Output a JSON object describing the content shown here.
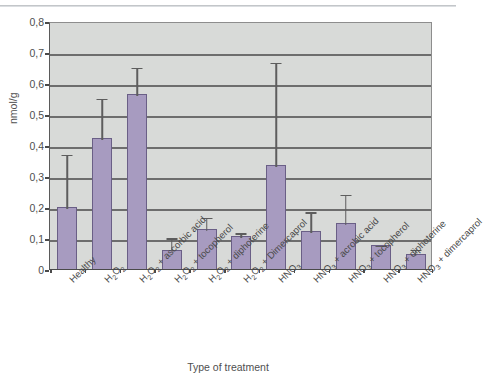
{
  "chart_data": {
    "type": "bar",
    "title": "",
    "xlabel": "Type of treatment",
    "ylabel": "nmol/g",
    "ylim": [
      0,
      0.8
    ],
    "ytick_step": 0.1,
    "grid": true,
    "legend": "none",
    "decimal_separator": ",",
    "ytick_labels": [
      "0,8",
      "0,7",
      "0,6",
      "0,5",
      "0,4",
      "0,3",
      "0,2",
      "0,1",
      "0"
    ],
    "ytick_values": [
      0.8,
      0.7,
      0.6,
      0.5,
      0.4,
      0.3,
      0.2,
      0.1,
      0
    ],
    "categories": [
      "Healthy",
      "H2O2",
      "H2O2 + ascorbic acid",
      "H2O2 + tocopherol",
      "H2O2 + diphoterine",
      "H2O2 + Dimercaprol",
      "HNO3",
      "HNO3 + acrobic acid",
      "HNO3 + tocopherol",
      "HNO3 + diphoterine",
      "HNO3 + dimercaprol"
    ],
    "values": [
      0.2,
      0.422,
      0.565,
      0.063,
      0.128,
      0.107,
      0.335,
      0.122,
      0.148,
      0.079,
      0.047
    ],
    "err_upper": [
      0.375,
      0.555,
      0.655,
      0.105,
      0.172,
      0.122,
      0.672,
      0.19,
      0.246,
      0.082,
      0.068
    ],
    "series": [
      {
        "name": "nmol/g",
        "values": [
          0.2,
          0.422,
          0.565,
          0.063,
          0.128,
          0.107,
          0.335,
          0.122,
          0.148,
          0.079,
          0.047
        ]
      }
    ]
  },
  "axis": {
    "y_title": "nmol/g",
    "x_title": "Type of treatment"
  },
  "xtick_labels": [
    {
      "base": "Healthy",
      "sub": "",
      "tail": ""
    },
    {
      "base": "H",
      "sub": "2",
      "tail": "O",
      "sub2": "2",
      "tail2": ""
    },
    {
      "base": "H",
      "sub": "2",
      "tail": "O",
      "sub2": "2",
      "tail2": " + ascorbic acid"
    },
    {
      "base": "H",
      "sub": "2",
      "tail": "O",
      "sub2": "2",
      "tail2": " + tocopherol"
    },
    {
      "base": "H",
      "sub": "2",
      "tail": "O",
      "sub2": "2",
      "tail2": " + diphoterine"
    },
    {
      "base": "H",
      "sub": "2",
      "tail": "O",
      "sub2": "2",
      "tail2": " + Dimercaprol"
    },
    {
      "base": "HNO",
      "sub": "3",
      "tail": "",
      "sub2": "",
      "tail2": ""
    },
    {
      "base": "HNO",
      "sub": "3",
      "tail": " + acrobic acid",
      "sub2": "",
      "tail2": ""
    },
    {
      "base": "HNO",
      "sub": "3",
      "tail": " + tocopherol",
      "sub2": "",
      "tail2": ""
    },
    {
      "base": "HNO",
      "sub": "3",
      "tail": " + diphoterine",
      "sub2": "",
      "tail2": ""
    },
    {
      "base": "HNO",
      "sub": "3",
      "tail": " + dimercaprol",
      "sub2": "",
      "tail2": ""
    }
  ],
  "colors": {
    "bar_fill": "#a79bc0",
    "bar_edge": "#6a5f86",
    "plot_bg": "#d8dad8",
    "gridline": "#6d6d6d",
    "text": "#4f4f4f"
  }
}
